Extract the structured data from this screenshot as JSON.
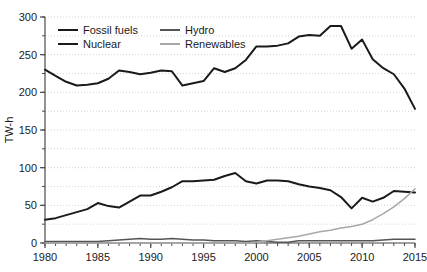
{
  "chart_data": {
    "type": "line",
    "title": "",
    "xlabel": "",
    "ylabel": "TW-h",
    "xlim": [
      1980,
      2015
    ],
    "ylim": [
      0,
      300
    ],
    "ytick_step": 50,
    "yminor_step": 25,
    "xtick_step": 5,
    "xminor_step": 1,
    "grid": "horizontal dotted every 25",
    "legend_position": "top-left inside plot, 2 columns x 2 rows",
    "yticks": [
      0,
      50,
      100,
      150,
      200,
      250,
      300
    ],
    "ytick_labels": [
      "0",
      "50",
      "100",
      "150",
      "200",
      "250",
      "300"
    ],
    "xticks": [
      1980,
      1985,
      1990,
      1995,
      2000,
      2005,
      2010,
      2015
    ],
    "xtick_labels": [
      "1980",
      "1985",
      "1990",
      "1995",
      "2000",
      "2005",
      "2010",
      "2015"
    ],
    "x": [
      1980,
      1981,
      1982,
      1983,
      1984,
      1985,
      1986,
      1987,
      1988,
      1989,
      1990,
      1991,
      1992,
      1993,
      1994,
      1995,
      1996,
      1997,
      1998,
      1999,
      2000,
      2001,
      2002,
      2003,
      2004,
      2005,
      2006,
      2007,
      2008,
      2009,
      2010,
      2011,
      2012,
      2013,
      2014,
      2015
    ],
    "series": [
      {
        "name": "Fossil fuels",
        "color": "#1a1a1a",
        "width": 2.0,
        "values": [
          230,
          222,
          214,
          209,
          210,
          212,
          218,
          229,
          227,
          224,
          226,
          229,
          228,
          209,
          212,
          215,
          232,
          227,
          232,
          243,
          261,
          261,
          262,
          265,
          274,
          276,
          275,
          288,
          288,
          258,
          270,
          244,
          232,
          224,
          205,
          178
        ]
      },
      {
        "name": "Nuclear",
        "color": "#1a1a1a",
        "width": 2.0,
        "values": [
          31,
          33,
          37,
          41,
          45,
          53,
          49,
          47,
          55,
          63,
          63,
          68,
          74,
          82,
          82,
          83,
          84,
          89,
          93,
          82,
          79,
          83,
          83,
          82,
          78,
          75,
          73,
          70,
          61,
          46,
          60,
          55,
          60,
          69,
          68,
          67
        ]
      },
      {
        "name": "Hydro",
        "color": "#555555",
        "width": 1.6,
        "values": [
          2,
          2,
          2,
          2,
          2,
          2,
          3,
          4,
          5,
          6,
          5,
          5,
          6,
          5,
          4,
          4,
          3,
          3,
          3,
          2,
          3,
          2,
          1,
          1,
          3,
          3,
          3,
          3,
          3,
          3,
          3,
          3,
          4,
          5,
          5,
          5
        ]
      },
      {
        "name": "Renewables",
        "color": "#a8a8a8",
        "width": 1.6,
        "values": [
          0,
          0,
          0,
          0,
          0,
          0,
          0,
          0,
          0,
          0,
          0,
          0,
          0,
          0,
          0,
          0,
          0,
          0,
          0,
          0,
          1,
          3,
          5,
          7,
          9,
          12,
          15,
          17,
          20,
          22,
          25,
          31,
          39,
          48,
          59,
          72
        ]
      }
    ],
    "legend_entries": [
      {
        "label": "Fossil fuels",
        "color": "#1a1a1a"
      },
      {
        "label": "Hydro",
        "color": "#555555"
      },
      {
        "label": "Nuclear",
        "color": "#1a1a1a"
      },
      {
        "label": "Renewables",
        "color": "#a8a8a8"
      }
    ],
    "colors": {
      "axis": "#4a4a4a",
      "grid": "#c9c9c9",
      "background": "#ffffff",
      "text": "#1a1a1a"
    }
  }
}
